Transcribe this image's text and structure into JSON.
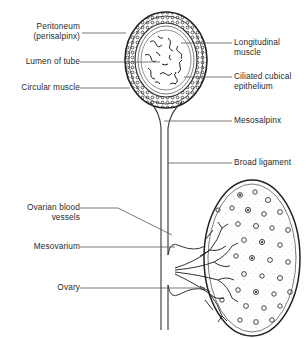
{
  "figure": {
    "colors": {
      "ink": "#2a2a2a",
      "line": "#555555",
      "background": "#ffffff"
    }
  },
  "labels_left": [
    {
      "id": "peritoneum",
      "line1": "Peritoneum",
      "line2": "(perisalpinx)"
    },
    {
      "id": "lumen",
      "line1": "Lumen of tube"
    },
    {
      "id": "circular-muscle",
      "line1": "Circular muscle"
    },
    {
      "id": "ovarian-vessels",
      "line1": "Ovarian blood",
      "line2": "vessels"
    },
    {
      "id": "mesovarium",
      "line1": "Mesovarium"
    },
    {
      "id": "ovary",
      "line1": "Ovary"
    }
  ],
  "labels_right": [
    {
      "id": "longitudinal-muscle",
      "line1": "Longitudinal",
      "line2": "muscle"
    },
    {
      "id": "ciliated-epithelium",
      "line1": "Ciliated cubical",
      "line2": "epithelium"
    },
    {
      "id": "mesosalpinx",
      "line1": "Mesosalpinx"
    },
    {
      "id": "broad-ligament",
      "line1": "Broad ligament"
    }
  ]
}
